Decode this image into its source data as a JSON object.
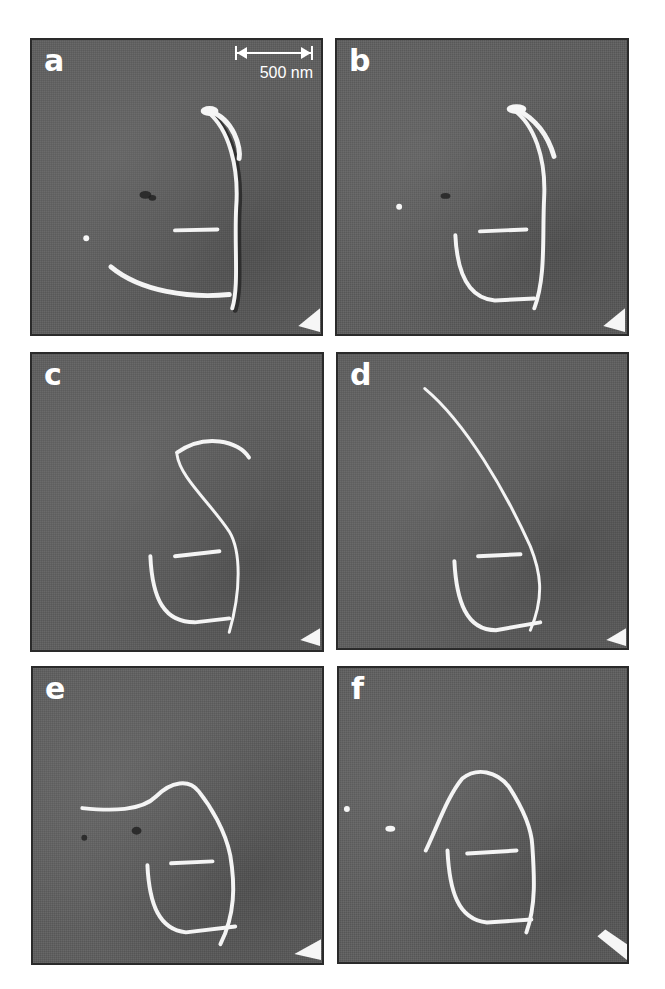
{
  "figure": {
    "scale_bar": {
      "label": "500 nm"
    },
    "panels": [
      {
        "id": "a",
        "label": "a",
        "has_scale_bar": true
      },
      {
        "id": "b",
        "label": "b",
        "has_scale_bar": false
      },
      {
        "id": "c",
        "label": "c",
        "has_scale_bar": false
      },
      {
        "id": "d",
        "label": "d",
        "has_scale_bar": false
      },
      {
        "id": "e",
        "label": "e",
        "has_scale_bar": false
      },
      {
        "id": "f",
        "label": "f",
        "has_scale_bar": false
      }
    ],
    "colors": {
      "background": "#5e5e5e",
      "tube": "#f4f4f4",
      "border": "#2a2a2a",
      "label": "#ffffff"
    }
  }
}
